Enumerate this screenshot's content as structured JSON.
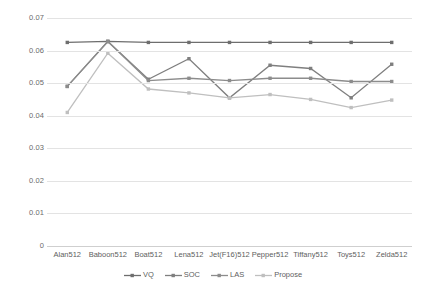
{
  "chart_data": {
    "type": "line",
    "title": "",
    "xlabel": "",
    "ylabel": "",
    "ylim": [
      0,
      0.07
    ],
    "yticks": [
      "0",
      "0.01",
      "0.02",
      "0.03",
      "0.04",
      "0.05",
      "0.06",
      "0.07"
    ],
    "ytick_values": [
      0,
      0.01,
      0.02,
      0.03,
      0.04,
      0.05,
      0.06,
      0.07
    ],
    "grid": true,
    "legend_position": "bottom",
    "categories": [
      "Alan512",
      "Baboon512",
      "Boat512",
      "Lena512",
      "Jet(F16)512",
      "Pepper512",
      "Tiffany512",
      "Toys512",
      "Zelda512"
    ],
    "series": [
      {
        "name": "VQ",
        "color": "#6e6e6e",
        "values": [
          0.0625,
          0.0628,
          0.0625,
          0.0625,
          0.0625,
          0.0625,
          0.0625,
          0.0625,
          0.0625
        ]
      },
      {
        "name": "SOC",
        "color": "#7f7f7f",
        "values": [
          0.049,
          0.0628,
          0.0512,
          0.0575,
          0.0455,
          0.0555,
          0.0545,
          0.0455,
          0.0558
        ]
      },
      {
        "name": "LAS",
        "color": "#8c8c8c",
        "values": [
          0.049,
          0.0628,
          0.0508,
          0.0515,
          0.0508,
          0.0515,
          0.0515,
          0.0505,
          0.0505
        ]
      },
      {
        "name": "Propose",
        "color": "#bfbfbf",
        "values": [
          0.041,
          0.0592,
          0.0482,
          0.047,
          0.0455,
          0.0465,
          0.045,
          0.0425,
          0.0448
        ]
      }
    ]
  }
}
